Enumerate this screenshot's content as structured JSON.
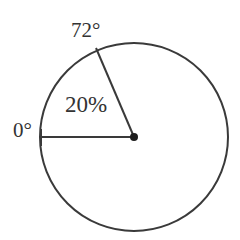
{
  "figure": {
    "background_color": "#ffffff",
    "stroke_color": "#3a3a3a",
    "text_color": "#333333"
  },
  "labels": {
    "start_angle": "0°",
    "end_angle": "72°",
    "percent": "20%"
  },
  "chart_data": {
    "type": "pie",
    "title": "",
    "subtitle": "",
    "xlabel": "",
    "ylabel": "",
    "legend_position": "none",
    "grid": false,
    "units": "degrees",
    "total_degrees": 360,
    "center_px": {
      "x": 134,
      "y": 137
    },
    "radius_px": 94,
    "angle_reference": "0° ray points left (west); angles measured clockwise on screen from that ray toward the top",
    "categories": [
      "Marked sector",
      "Remainder"
    ],
    "values": [
      20,
      80
    ],
    "annotations": [
      {
        "name": "start-angle",
        "text": "0°",
        "degrees": 0,
        "position_px": {
          "x": 13,
          "y": 120
        }
      },
      {
        "name": "end-angle",
        "text": "72°",
        "degrees": 72,
        "position_px": {
          "x": 71,
          "y": 20
        }
      },
      {
        "name": "sector-percent",
        "text": "20%",
        "value": 20,
        "position_px": {
          "x": 65,
          "y": 93
        }
      }
    ],
    "radii": [
      {
        "name": "radius-0-degrees",
        "degrees": 0,
        "from_px": {
          "x": 134,
          "y": 137
        },
        "to_px": {
          "x": 40,
          "y": 137
        }
      },
      {
        "name": "radius-72-degrees",
        "degrees": 72,
        "from_px": {
          "x": 134,
          "y": 137
        },
        "to_px": {
          "x": 96,
          "y": 48
        }
      }
    ],
    "center_point": {
      "name": "center-dot",
      "px": {
        "x": 134,
        "y": 137
      },
      "radius_px": 4
    }
  }
}
